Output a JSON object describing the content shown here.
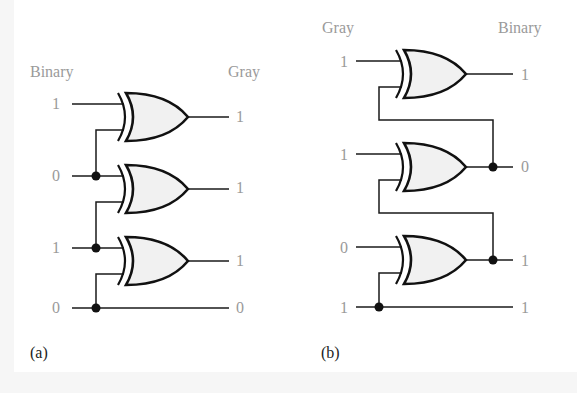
{
  "figure": {
    "panel_a": {
      "caption": "(a)",
      "title": "Binary-to-Gray conversion",
      "input_header": "Binary",
      "output_header": "Gray",
      "inputs": [
        "1",
        "0",
        "1",
        "0"
      ],
      "outputs": [
        "1",
        "1",
        "1",
        "0"
      ],
      "gate_type": "XOR",
      "gate_count": 3
    },
    "panel_b": {
      "caption": "(b)",
      "title": "Gray-to-Binary conversion",
      "input_header": "Gray",
      "output_header": "Binary",
      "inputs": [
        "1",
        "1",
        "0",
        "1"
      ],
      "outputs": [
        "1",
        "0",
        "1",
        "1"
      ],
      "gate_type": "XOR",
      "gate_count": 3
    },
    "colors": {
      "label_gray": "#9a9a9a",
      "line": "#1a1a1a",
      "gate_fill": "#f1f1f1",
      "background": "#ffffff"
    }
  }
}
